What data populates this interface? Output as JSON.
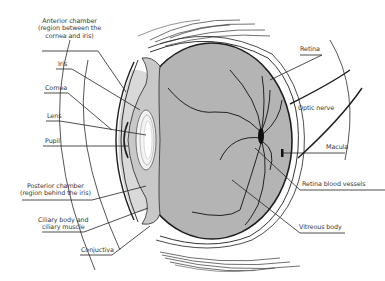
{
  "diagram": {
    "colors": {
      "vitreous": "#b4b4b4",
      "anterior_chamber": "#d6d6d6",
      "lens": "#f2f2f2",
      "outline": "#1e1e1e",
      "vessels": "#111111",
      "label_text": "#3a3a3a"
    },
    "labels": {
      "anterior_chamber": {
        "line1": "Anterior chamber",
        "line2": "(region between the",
        "line3": "cornea and iris)"
      },
      "iris": {
        "text": "Iris"
      },
      "cornea": {
        "text": "Cornea"
      },
      "lens": {
        "text": "Lens"
      },
      "pupil": {
        "text": "Pupil"
      },
      "posterior_chamber": {
        "line1": "Posterior chamber",
        "line2": "(region behind the iris)"
      },
      "ciliary": {
        "line1": "Ciliary body and",
        "line2": "ciliary muscle"
      },
      "conjunctiva": {
        "text": "Conjuctiva"
      },
      "retina": {
        "text": "Retina"
      },
      "optic_nerve": {
        "text": "Optic nerve"
      },
      "macula": {
        "text": "Macula"
      },
      "retina_vessels": {
        "text": "Retina blood vessels"
      },
      "vitreous_body": {
        "text": "Vitreous body"
      }
    }
  }
}
